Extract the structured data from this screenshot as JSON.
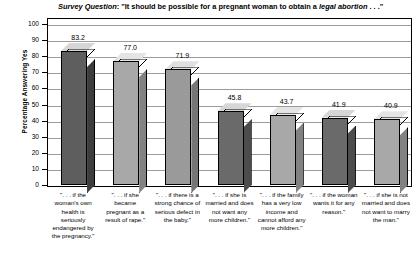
{
  "chart_data": {
    "type": "bar",
    "title": "Survey Question: \"It should be possible for a pregnant woman to obtain a legal abortion . . .\"",
    "title_prefix": "Survey Question",
    "title_body": ": \"It should be possible for a pregnant woman to obtain a ",
    "title_emphasis": "legal abortion",
    "title_suffix": " . . .\"",
    "xlabel": "",
    "ylabel": "Percentage Answering Yes",
    "ylim": [
      0,
      100
    ],
    "ytick_step": 10,
    "yticks": [
      "100",
      "90",
      "80",
      "70",
      "60",
      "50",
      "40",
      "30",
      "20",
      "10",
      "0"
    ],
    "grid": true,
    "legend": "none",
    "categories": [
      "\". . . if the woman's own health is seriously endangered by the pregnancy.\"",
      "\". . . if she became pregnant as a result of rape.\"",
      "\". . . if there is a strong chance of serious defect in the baby.\"",
      "\". . . if she is married and does not want any more children.\"",
      "\". . . if the family has a very low income and cannot afford any more children.\"",
      "\". . . if the woman wants it for any reason.\"",
      "\". . . if she is not married and does not want to marry the man.\""
    ],
    "values": [
      83.2,
      77.0,
      71.9,
      45.8,
      43.7,
      41.9,
      40.9
    ],
    "value_labels": [
      "83.2",
      "77.0",
      "71.9",
      "45.8",
      "43.7",
      "41.9",
      "40.9"
    ],
    "bar_colors": [
      "#5e5e5e",
      "#a8a8a8",
      "#9a9a9a",
      "#6a6a6a",
      "#a8a8a8",
      "#6a6a6a",
      "#a8a8a8"
    ],
    "bar_side_colors": [
      "#3d3d3d",
      "#828282",
      "#767676",
      "#4c4c4c",
      "#828282",
      "#4c4c4c",
      "#828282"
    ],
    "bar_top_colors": [
      "#d6d6d6",
      "#e4e4e4",
      "#e0e0e0",
      "#d6d6d6",
      "#e4e4e4",
      "#d6d6d6",
      "#e4e4e4"
    ]
  }
}
